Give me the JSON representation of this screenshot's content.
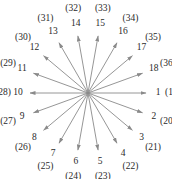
{
  "diagram": {
    "type": "radial-arrow-diagram",
    "center": [
      88,
      93
    ],
    "arrow_color": "#8a8a8a",
    "text_color": "#2a2a2a",
    "arrows": [
      {
        "n": "1",
        "paired": "(19)",
        "angle_deg": 0
      },
      {
        "n": "2",
        "paired": "(20)",
        "angle_deg": 20
      },
      {
        "n": "3",
        "paired": "(21)",
        "angle_deg": 40
      },
      {
        "n": "4",
        "paired": "(22)",
        "angle_deg": 60
      },
      {
        "n": "5",
        "paired": "(23)",
        "angle_deg": 80
      },
      {
        "n": "6",
        "paired": "(24)",
        "angle_deg": 100
      },
      {
        "n": "7",
        "paired": "(25)",
        "angle_deg": 120
      },
      {
        "n": "8",
        "paired": "(26)",
        "angle_deg": 140
      },
      {
        "n": "9",
        "paired": "(27)",
        "angle_deg": 160
      },
      {
        "n": "10",
        "paired": "(28)",
        "angle_deg": 180
      },
      {
        "n": "11",
        "paired": "(29)",
        "angle_deg": 200
      },
      {
        "n": "12",
        "paired": "(30)",
        "angle_deg": 220
      },
      {
        "n": "13",
        "paired": "(31)",
        "angle_deg": 240
      },
      {
        "n": "14",
        "paired": "(32)",
        "angle_deg": 260
      },
      {
        "n": "15",
        "paired": "(33)",
        "angle_deg": 280
      },
      {
        "n": "16",
        "paired": "(34)",
        "angle_deg": 300
      },
      {
        "n": "17",
        "paired": "(35)",
        "angle_deg": 320
      },
      {
        "n": "18",
        "paired": "(36)",
        "angle_deg": 340
      }
    ]
  }
}
